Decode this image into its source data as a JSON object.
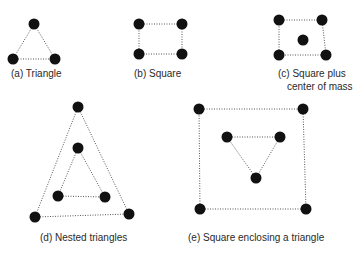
{
  "diagram": {
    "panels": [
      {
        "id": "a",
        "label": "(a) Triangle",
        "label_lines": [
          "(a) Triangle"
        ],
        "shape": "triangle",
        "node_count": 3,
        "edges": [
          [
            0,
            1
          ],
          [
            1,
            2
          ],
          [
            2,
            0
          ]
        ]
      },
      {
        "id": "b",
        "label": "(b) Square",
        "label_lines": [
          "(b) Square"
        ],
        "shape": "square",
        "node_count": 4,
        "edges": [
          [
            0,
            1
          ],
          [
            1,
            3
          ],
          [
            3,
            2
          ],
          [
            2,
            0
          ]
        ]
      },
      {
        "id": "c",
        "label": "(c) Square plus center of mass",
        "label_lines": [
          "(c) Square plus",
          "center of mass"
        ],
        "shape": "square-plus-center",
        "node_count": 5,
        "edges": [
          [
            0,
            1
          ],
          [
            1,
            3
          ],
          [
            3,
            2
          ],
          [
            2,
            0
          ]
        ]
      },
      {
        "id": "d",
        "label": "(d) Nested triangles",
        "label_lines": [
          "(d) Nested triangles"
        ],
        "shape": "nested-triangles",
        "node_count": 6,
        "edges": [
          [
            0,
            1
          ],
          [
            1,
            2
          ],
          [
            2,
            0
          ],
          [
            3,
            4
          ],
          [
            4,
            5
          ],
          [
            5,
            3
          ]
        ]
      },
      {
        "id": "e",
        "label": "(e) Square enclosing a triangle",
        "label_lines": [
          "(e) Square enclosing a triangle"
        ],
        "shape": "square-enclosing-triangle",
        "node_count": 7,
        "edges": [
          [
            0,
            1
          ],
          [
            1,
            3
          ],
          [
            3,
            2
          ],
          [
            2,
            0
          ],
          [
            4,
            5
          ],
          [
            5,
            6
          ],
          [
            6,
            4
          ]
        ]
      }
    ],
    "colors": {
      "node": "#111111",
      "edge": "#555555",
      "text": "#2a2a2a",
      "background": "#ffffff"
    }
  }
}
